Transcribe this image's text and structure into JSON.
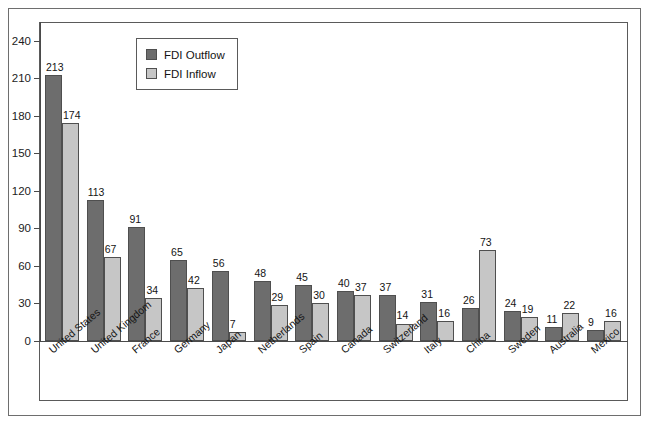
{
  "chart_data": {
    "type": "bar",
    "title": "",
    "xlabel": "",
    "ylabel": "",
    "ylim": [
      0,
      255
    ],
    "yticks": [
      0,
      30,
      60,
      90,
      120,
      150,
      180,
      210,
      240
    ],
    "grid": false,
    "legend_position": "top-left-inside",
    "categories": [
      "United States",
      "United Kingdom",
      "France",
      "Germany",
      "Japan",
      "Netherlands",
      "Spain",
      "Canada",
      "Switzerland",
      "Italy",
      "China",
      "Sweden",
      "Australia",
      "Mexico"
    ],
    "series": [
      {
        "name": "FDI Outflow",
        "color": "#6d6d6d",
        "values": [
          213,
          113,
          91,
          65,
          56,
          48,
          45,
          40,
          37,
          31,
          26,
          24,
          11,
          9
        ]
      },
      {
        "name": "FDI Inflow",
        "color": "#c6c6c6",
        "values": [
          174,
          67,
          34,
          42,
          7,
          29,
          30,
          37,
          14,
          16,
          73,
          19,
          22,
          16
        ]
      }
    ]
  },
  "legend": {
    "items": [
      {
        "label": "FDI Outflow",
        "swatch": "outflow"
      },
      {
        "label": "FDI Inflow",
        "swatch": "inflow"
      }
    ]
  },
  "colors": {
    "outflow": "#6d6d6d",
    "inflow": "#c6c6c6",
    "axis": "#4a4a4a",
    "frame": "#5a5a5a",
    "outer_frame": "#6e6e6e",
    "text": "#141414",
    "background": "#ffffff"
  }
}
